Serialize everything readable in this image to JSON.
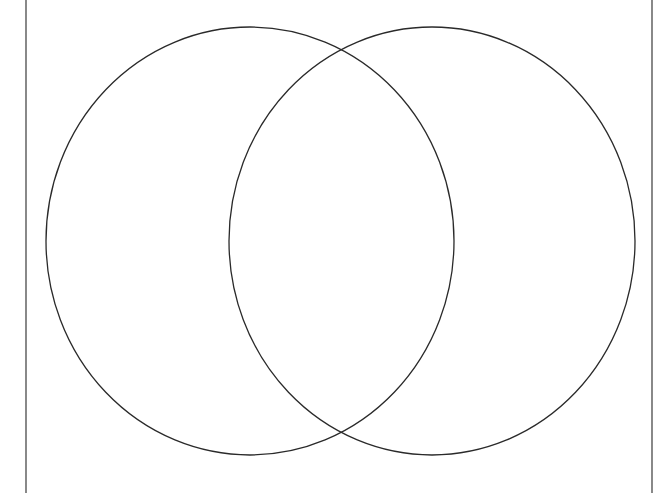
{
  "diagram": {
    "type": "venn",
    "background": "#ffffff",
    "stroke_color": "#2a2a2a",
    "frame": {
      "left_x": 26,
      "right_x": 652,
      "top_y": 0,
      "bottom_y": 493,
      "color": "#3a3a3a"
    },
    "circles": [
      {
        "name": "left-set",
        "cx": 250,
        "cy": 241,
        "rx": 204,
        "ry": 214,
        "label": ""
      },
      {
        "name": "right-set",
        "cx": 432,
        "cy": 241,
        "rx": 203,
        "ry": 214,
        "label": ""
      }
    ],
    "regions": {
      "left_only": "",
      "intersection": "",
      "right_only": ""
    }
  }
}
